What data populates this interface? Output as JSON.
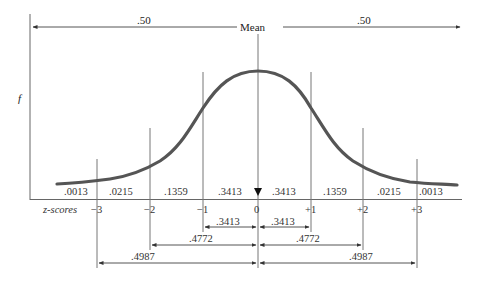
{
  "diagram": {
    "mean_label": "Mean",
    "y_axis_label": "f",
    "x_axis_label": "z-scores",
    "half_areas": {
      "left": ".50",
      "right": ".50"
    },
    "z_ticks": [
      "−3",
      "−2",
      "−1",
      "0",
      "+1",
      "+2",
      "+3"
    ],
    "segment_areas": [
      ".0013",
      ".0215",
      ".1359",
      ".3413",
      ".3413",
      ".1359",
      ".0215",
      ".0013"
    ],
    "cumulative_spans": [
      {
        "left": ".3413",
        "right": ".3413",
        "range": "±1"
      },
      {
        "left": ".4772",
        "right": ".4772",
        "range": "±2"
      },
      {
        "left": ".4987",
        "right": ".4987",
        "range": "±3"
      }
    ],
    "colors": {
      "curve": "#555555",
      "lines": "#777777",
      "text": "#222222"
    }
  }
}
